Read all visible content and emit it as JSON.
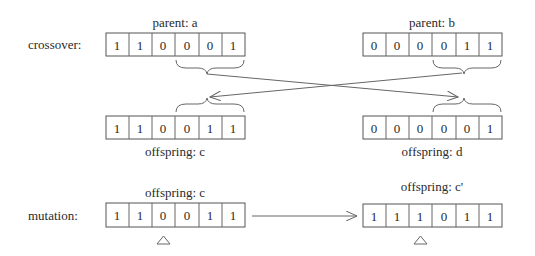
{
  "diagram": {
    "crossover": {
      "row_label": "crossover:",
      "parent_a": {
        "label": "parent: a",
        "bits": [
          "1",
          "1",
          "0",
          "0",
          "0",
          "1"
        ]
      },
      "parent_b": {
        "label": "parent: b",
        "bits": [
          "0",
          "0",
          "0",
          "0",
          "1",
          "1"
        ]
      },
      "offspring_c": {
        "label": "offspring: c",
        "bits": [
          "1",
          "1",
          "0",
          "0",
          "1",
          "1"
        ]
      },
      "offspring_d": {
        "label": "offspring: d",
        "bits": [
          "0",
          "0",
          "0",
          "0",
          "0",
          "1"
        ]
      },
      "swapped_segment": {
        "start_index": 3,
        "end_index": 5
      }
    },
    "mutation": {
      "row_label": "mutation:",
      "before": {
        "label": "offspring: c",
        "bits": [
          "1",
          "1",
          "0",
          "0",
          "1",
          "1"
        ]
      },
      "after": {
        "label": "offspring: c'",
        "bits": [
          "1",
          "1",
          "1",
          "0",
          "1",
          "1"
        ]
      },
      "mutated_index": 2,
      "marker_icon": "triangle-up-icon"
    },
    "colors": {
      "stroke": "#555555",
      "text": "#2a2a2a",
      "background": "#ffffff"
    }
  }
}
